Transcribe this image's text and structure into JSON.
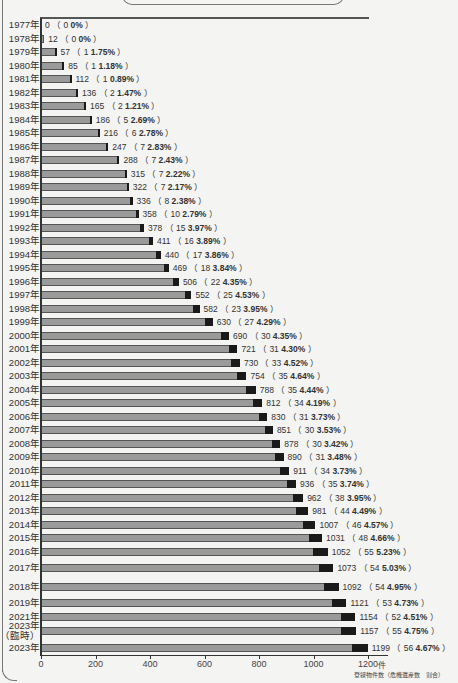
{
  "chart_data": {
    "type": "bar",
    "orientation": "horizontal",
    "title": "",
    "xlabel": "件",
    "ylabel": "",
    "xlim": [
      0,
      1200
    ],
    "x_ticks": [
      "0",
      "200",
      "400",
      "600",
      "800",
      "1000",
      "1200"
    ],
    "legend_text": "登録物件数（危機遺産数　割合）",
    "grid": false,
    "categories": [
      "1977年",
      "1978年",
      "1979年",
      "1980年",
      "1981年",
      "1982年",
      "1983年",
      "1984年",
      "1985年",
      "1986年",
      "1987年",
      "1988年",
      "1989年",
      "1990年",
      "1991年",
      "1992年",
      "1993年",
      "1994年",
      "1995年",
      "1996年",
      "1997年",
      "1998年",
      "1999年",
      "2000年",
      "2001年",
      "2002年",
      "2003年",
      "2004年",
      "2005年",
      "2006年",
      "2007年",
      "2008年",
      "2009年",
      "2010年",
      "2011年",
      "2012年",
      "2013年",
      "2014年",
      "2015年",
      "2016年",
      "2017年",
      "2018年",
      "2019年",
      "2021年",
      "2023年（臨時）",
      "2023年"
    ],
    "series": [
      {
        "name": "登録物件数",
        "values": [
          0,
          12,
          57,
          85,
          112,
          136,
          165,
          186,
          216,
          247,
          288,
          315,
          322,
          336,
          358,
          378,
          411,
          440,
          469,
          506,
          552,
          582,
          630,
          690,
          721,
          730,
          754,
          788,
          812,
          830,
          851,
          878,
          890,
          911,
          936,
          962,
          981,
          1007,
          1031,
          1052,
          1073,
          1092,
          1121,
          1154,
          1157,
          1199
        ]
      },
      {
        "name": "危機遺産数",
        "values": [
          0,
          0,
          1,
          1,
          1,
          2,
          2,
          5,
          6,
          7,
          7,
          7,
          7,
          8,
          10,
          15,
          16,
          17,
          18,
          22,
          25,
          23,
          27,
          30,
          31,
          33,
          35,
          35,
          34,
          31,
          30,
          30,
          31,
          34,
          35,
          38,
          44,
          46,
          48,
          55,
          54,
          54,
          53,
          52,
          55,
          56
        ]
      },
      {
        "name": "割合",
        "values": [
          "0%",
          "0%",
          "1.75%",
          "1.18%",
          "0.89%",
          "1.47%",
          "1.21%",
          "2.69%",
          "2.78%",
          "2.83%",
          "2.43%",
          "2.22%",
          "2.17%",
          "2.38%",
          "2.79%",
          "3.97%",
          "3.89%",
          "3.86%",
          "3.84%",
          "4.35%",
          "4.53%",
          "3.95%",
          "4.29%",
          "4.35%",
          "4.30%",
          "4.52%",
          "4.64%",
          "4.44%",
          "4.19%",
          "3.73%",
          "3.53%",
          "3.42%",
          "3.48%",
          "3.73%",
          "3.74%",
          "3.95%",
          "4.49%",
          "4.57%",
          "4.66%",
          "5.23%",
          "5.03%",
          "4.95%",
          "4.73%",
          "4.51%",
          "4.75%",
          "4.67%"
        ]
      }
    ]
  },
  "rows": [
    {
      "year": "1977年",
      "total": "0",
      "danger": "0",
      "pct": "0%"
    },
    {
      "year": "1978年",
      "total": "12",
      "danger": "0",
      "pct": "0%"
    },
    {
      "year": "1979年",
      "total": "57",
      "danger": "1",
      "pct": "1.75%"
    },
    {
      "year": "1980年",
      "total": "85",
      "danger": "1",
      "pct": "1.18%"
    },
    {
      "year": "1981年",
      "total": "112",
      "danger": "1",
      "pct": "0.89%"
    },
    {
      "year": "1982年",
      "total": "136",
      "danger": "2",
      "pct": "1.47%"
    },
    {
      "year": "1983年",
      "total": "165",
      "danger": "2",
      "pct": "1.21%"
    },
    {
      "year": "1984年",
      "total": "186",
      "danger": "5",
      "pct": "2.69%"
    },
    {
      "year": "1985年",
      "total": "216",
      "danger": "6",
      "pct": "2.78%"
    },
    {
      "year": "1986年",
      "total": "247",
      "danger": "7",
      "pct": "2.83%"
    },
    {
      "year": "1987年",
      "total": "288",
      "danger": "7",
      "pct": "2.43%"
    },
    {
      "year": "1988年",
      "total": "315",
      "danger": "7",
      "pct": "2.22%"
    },
    {
      "year": "1989年",
      "total": "322",
      "danger": "7",
      "pct": "2.17%"
    },
    {
      "year": "1990年",
      "total": "336",
      "danger": "8",
      "pct": "2.38%"
    },
    {
      "year": "1991年",
      "total": "358",
      "danger": "10",
      "pct": "2.79%"
    },
    {
      "year": "1992年",
      "total": "378",
      "danger": "15",
      "pct": "3.97%"
    },
    {
      "year": "1993年",
      "total": "411",
      "danger": "16",
      "pct": "3.89%"
    },
    {
      "year": "1994年",
      "total": "440",
      "danger": "17",
      "pct": "3.86%"
    },
    {
      "year": "1995年",
      "total": "469",
      "danger": "18",
      "pct": "3.84%"
    },
    {
      "year": "1996年",
      "total": "506",
      "danger": "22",
      "pct": "4.35%"
    },
    {
      "year": "1997年",
      "total": "552",
      "danger": "25",
      "pct": "4.53%"
    },
    {
      "year": "1998年",
      "total": "582",
      "danger": "23",
      "pct": "3.95%"
    },
    {
      "year": "1999年",
      "total": "630",
      "danger": "27",
      "pct": "4.29%"
    },
    {
      "year": "2000年",
      "total": "690",
      "danger": "30",
      "pct": "4.35%"
    },
    {
      "year": "2001年",
      "total": "721",
      "danger": "31",
      "pct": "4.30%"
    },
    {
      "year": "2002年",
      "total": "730",
      "danger": "33",
      "pct": "4.52%"
    },
    {
      "year": "2003年",
      "total": "754",
      "danger": "35",
      "pct": "4.64%"
    },
    {
      "year": "2004年",
      "total": "788",
      "danger": "35",
      "pct": "4.44%"
    },
    {
      "year": "2005年",
      "total": "812",
      "danger": "34",
      "pct": "4.19%"
    },
    {
      "year": "2006年",
      "total": "830",
      "danger": "31",
      "pct": "3.73%"
    },
    {
      "year": "2007年",
      "total": "851",
      "danger": "30",
      "pct": "3.53%"
    },
    {
      "year": "2008年",
      "total": "878",
      "danger": "30",
      "pct": "3.42%"
    },
    {
      "year": "2009年",
      "total": "890",
      "danger": "31",
      "pct": "3.48%"
    },
    {
      "year": "2010年",
      "total": "911",
      "danger": "34",
      "pct": "3.73%"
    },
    {
      "year": "2011年",
      "total": "936",
      "danger": "35",
      "pct": "3.74%"
    },
    {
      "year": "2012年",
      "total": "962",
      "danger": "38",
      "pct": "3.95%"
    },
    {
      "year": "2013年",
      "total": "981",
      "danger": "44",
      "pct": "4.49%"
    },
    {
      "year": "2014年",
      "total": "1007",
      "danger": "46",
      "pct": "4.57%"
    },
    {
      "year": "2015年",
      "total": "1031",
      "danger": "48",
      "pct": "4.66%"
    },
    {
      "year": "2016年",
      "total": "1052",
      "danger": "55",
      "pct": "5.23%"
    },
    {
      "year": "2017年",
      "total": "1073",
      "danger": "54",
      "pct": "5.03%"
    },
    {
      "year": "2018年",
      "total": "1092",
      "danger": "54",
      "pct": "4.95%"
    },
    {
      "year": "2019年",
      "total": "1121",
      "danger": "53",
      "pct": "4.73%"
    },
    {
      "year": "2021年",
      "total": "1154",
      "danger": "52",
      "pct": "4.51%"
    },
    {
      "year": "2023年",
      "sub": "（臨時）",
      "total": "1157",
      "danger": "55",
      "pct": "4.75%"
    },
    {
      "year": "2023年",
      "total": "1199",
      "danger": "56",
      "pct": "4.67%"
    }
  ],
  "axis": {
    "ticks": [
      "0",
      "200",
      "400",
      "600",
      "800",
      "1000",
      "1200"
    ],
    "unit": "件",
    "legend": "登録物件数（危機遺産数　割合）"
  },
  "banner": {
    "text": ""
  }
}
